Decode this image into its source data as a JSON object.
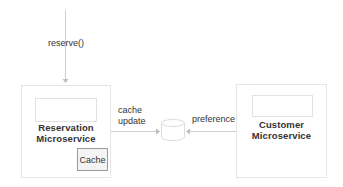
{
  "diagram": {
    "entry_call": {
      "label": "reserve()"
    },
    "reservation_service": {
      "title_line1": "Reservation",
      "title_line2": "Microservice",
      "cache_label": "Cache"
    },
    "customer_service": {
      "title_line1": "Customer",
      "title_line2": "Microservice"
    },
    "edges": {
      "cache_update_line1": "cache",
      "cache_update_line2": "update",
      "preference": "preference"
    },
    "colors": {
      "box_border": "#e6e6e6",
      "line": "#c8c8c8",
      "cache_border": "#9a9a9a",
      "cache_fill": "#f4f4f4",
      "text": "#333333"
    }
  }
}
